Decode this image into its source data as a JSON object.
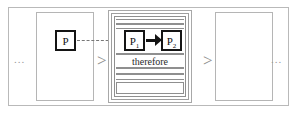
{
  "diagram": {
    "type": "flow-diagram",
    "colors": {
      "frame": "#b9b9b9",
      "panel_border": "#b5b5b5",
      "box_border": "#141414",
      "separator": "#8d8d8d",
      "ellipsis": "#9a9a9a",
      "arrow": "#141414",
      "dashed_link": "#777777",
      "background": "#ffffff"
    },
    "ellipsis_left": "...",
    "ellipsis_right": "...",
    "separator_left": ">",
    "separator_right": ">",
    "left_panel": {
      "label": "",
      "box": {
        "text": "P",
        "subscript": ""
      }
    },
    "right_panel": {
      "label": ""
    },
    "middle_group": {
      "premise_box": {
        "text": "P",
        "subscript": "1"
      },
      "conclusion_box": {
        "text": "P",
        "subscript": "2"
      },
      "arrow": "→",
      "therefore_label": "therefore",
      "bands": [
        {
          "name": "band-a",
          "text": ""
        },
        {
          "name": "band-b",
          "text": ""
        },
        {
          "name": "band-row",
          "text": ""
        },
        {
          "name": "band-therefore",
          "text": "therefore"
        },
        {
          "name": "band-c",
          "text": ""
        },
        {
          "name": "band-d",
          "text": ""
        },
        {
          "name": "band-e",
          "text": ""
        }
      ]
    },
    "dashed_connector": {
      "from": "P",
      "to": "P1",
      "style": "dashed"
    }
  }
}
